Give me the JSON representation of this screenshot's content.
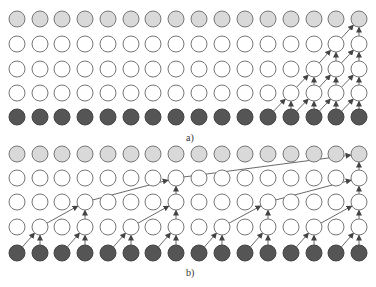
{
  "diagram": {
    "columns": 16,
    "col_x": [
      17,
      40,
      62,
      85,
      108,
      131,
      153,
      176,
      199,
      222,
      245,
      268,
      291,
      314,
      336,
      359
    ],
    "radius": 8,
    "colors": {
      "output": "#d9d9d9",
      "hidden": "#ffffff",
      "input": "#555555",
      "stroke": "#777777",
      "arrow": "#444444"
    },
    "panels": [
      {
        "label": "a)",
        "label_pos": [
          186,
          140
        ],
        "rows_y": [
          117,
          93,
          69,
          44,
          19
        ],
        "row_types": [
          "input",
          "hidden",
          "hidden",
          "hidden",
          "output"
        ],
        "edges": [
          [
            0,
            11,
            1,
            12
          ],
          [
            0,
            12,
            1,
            12
          ],
          [
            0,
            12,
            1,
            13
          ],
          [
            0,
            13,
            1,
            13
          ],
          [
            0,
            13,
            1,
            14
          ],
          [
            0,
            14,
            1,
            14
          ],
          [
            0,
            14,
            1,
            15
          ],
          [
            0,
            15,
            1,
            15
          ],
          [
            1,
            12,
            2,
            13
          ],
          [
            1,
            13,
            2,
            13
          ],
          [
            1,
            13,
            2,
            14
          ],
          [
            1,
            14,
            2,
            14
          ],
          [
            1,
            14,
            2,
            15
          ],
          [
            1,
            15,
            2,
            15
          ],
          [
            2,
            13,
            3,
            14
          ],
          [
            2,
            14,
            3,
            14
          ],
          [
            2,
            14,
            3,
            15
          ],
          [
            2,
            15,
            3,
            15
          ],
          [
            3,
            14,
            4,
            15
          ],
          [
            3,
            15,
            4,
            15
          ]
        ]
      },
      {
        "label": "b)",
        "label_pos": [
          186,
          275
        ],
        "rows_y": [
          253,
          227,
          202,
          178,
          154
        ],
        "row_types": [
          "input",
          "hidden",
          "hidden",
          "hidden",
          "output"
        ],
        "edges": [
          [
            0,
            0,
            1,
            1
          ],
          [
            0,
            1,
            1,
            1
          ],
          [
            0,
            2,
            1,
            3
          ],
          [
            0,
            3,
            1,
            3
          ],
          [
            0,
            4,
            1,
            5
          ],
          [
            0,
            5,
            1,
            5
          ],
          [
            0,
            6,
            1,
            7
          ],
          [
            0,
            7,
            1,
            7
          ],
          [
            0,
            8,
            1,
            9
          ],
          [
            0,
            9,
            1,
            9
          ],
          [
            0,
            10,
            1,
            11
          ],
          [
            0,
            11,
            1,
            11
          ],
          [
            0,
            12,
            1,
            13
          ],
          [
            0,
            13,
            1,
            13
          ],
          [
            0,
            14,
            1,
            15
          ],
          [
            0,
            15,
            1,
            15
          ],
          [
            1,
            1,
            2,
            3
          ],
          [
            1,
            3,
            2,
            3
          ],
          [
            1,
            5,
            2,
            7
          ],
          [
            1,
            7,
            2,
            7
          ],
          [
            1,
            9,
            2,
            11
          ],
          [
            1,
            11,
            2,
            11
          ],
          [
            1,
            13,
            2,
            15
          ],
          [
            1,
            15,
            2,
            15
          ],
          [
            2,
            3,
            3,
            7
          ],
          [
            2,
            7,
            3,
            7
          ],
          [
            2,
            11,
            3,
            15
          ],
          [
            2,
            15,
            3,
            15
          ],
          [
            3,
            7,
            4,
            15
          ],
          [
            3,
            15,
            4,
            15
          ]
        ]
      }
    ]
  }
}
